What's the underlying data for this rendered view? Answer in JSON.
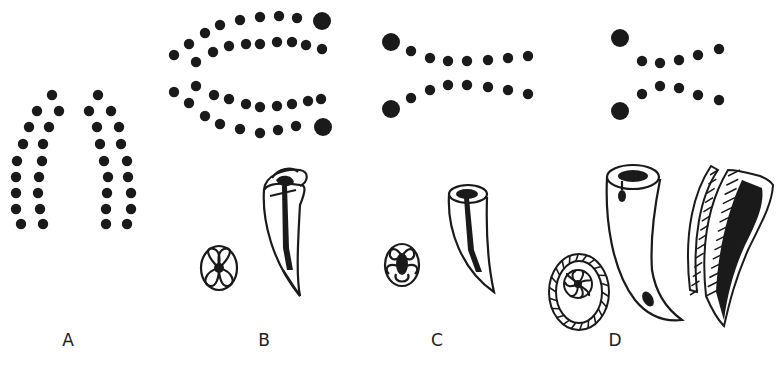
{
  "figure": {
    "panels": [
      {
        "id": "A",
        "label": "A",
        "label_x": 58
      },
      {
        "id": "B",
        "label": "B",
        "label_x": 254
      },
      {
        "id": "C",
        "label": "C",
        "label_x": 427
      },
      {
        "id": "D",
        "label": "D",
        "label_x": 605
      }
    ],
    "colors": {
      "ink": "#1a1a1a",
      "background": "#ffffff",
      "label": "#222222"
    },
    "dot_radius": 5.2,
    "big_dot_radius": 9,
    "dots": {
      "A": [
        [
          52,
          95
        ],
        [
          37,
          111
        ],
        [
          59,
          111
        ],
        [
          29,
          127
        ],
        [
          49,
          127
        ],
        [
          23,
          144
        ],
        [
          43,
          144
        ],
        [
          17,
          161
        ],
        [
          42,
          161
        ],
        [
          16,
          177
        ],
        [
          39,
          177
        ],
        [
          16,
          193
        ],
        [
          38,
          193
        ],
        [
          16,
          209
        ],
        [
          40,
          209
        ],
        [
          21,
          224
        ],
        [
          43,
          224
        ],
        [
          98,
          95
        ],
        [
          89,
          111
        ],
        [
          111,
          111
        ],
        [
          97,
          127
        ],
        [
          119,
          127
        ],
        [
          100,
          144
        ],
        [
          121,
          144
        ],
        [
          104,
          161
        ],
        [
          127,
          161
        ],
        [
          108,
          177
        ],
        [
          128,
          177
        ],
        [
          107,
          193
        ],
        [
          131,
          193
        ],
        [
          106,
          209
        ],
        [
          131,
          209
        ],
        [
          106,
          224
        ],
        [
          127,
          224
        ]
      ],
      "B": [
        [
          174,
          55
        ],
        [
          189,
          44
        ],
        [
          205,
          33
        ],
        [
          220,
          25
        ],
        [
          240,
          20
        ],
        [
          260,
          17
        ],
        [
          279,
          16
        ],
        [
          297,
          18
        ],
        [
          196,
          62
        ],
        [
          213,
          52
        ],
        [
          229,
          46
        ],
        [
          246,
          44
        ],
        [
          260,
          44
        ],
        [
          277,
          42
        ],
        [
          292,
          42
        ],
        [
          306,
          45
        ],
        [
          322,
          49
        ],
        [
          174,
          92
        ],
        [
          196,
          86
        ],
        [
          214,
          95
        ],
        [
          229,
          99
        ],
        [
          246,
          104
        ],
        [
          260,
          107
        ],
        [
          277,
          106
        ],
        [
          292,
          104
        ],
        [
          308,
          101
        ],
        [
          321,
          99
        ],
        [
          189,
          103
        ],
        [
          205,
          116
        ],
        [
          220,
          124
        ],
        [
          240,
          129
        ],
        [
          260,
          133
        ],
        [
          278,
          130
        ],
        [
          296,
          126
        ]
      ],
      "B_big": [
        [
          322,
          21
        ],
        [
          323,
          127
        ]
      ],
      "C": [
        [
          411,
          51
        ],
        [
          430,
          58
        ],
        [
          448,
          61
        ],
        [
          467,
          61
        ],
        [
          488,
          60
        ],
        [
          508,
          58
        ],
        [
          528,
          56
        ],
        [
          411,
          98
        ],
        [
          430,
          90
        ],
        [
          448,
          85
        ],
        [
          467,
          85
        ],
        [
          488,
          87
        ],
        [
          508,
          90
        ],
        [
          528,
          94
        ]
      ],
      "C_big": [
        [
          391,
          42
        ],
        [
          391,
          109
        ]
      ],
      "D": [
        [
          642,
          61
        ],
        [
          660,
          63
        ],
        [
          679,
          60
        ],
        [
          698,
          55
        ],
        [
          719,
          49
        ],
        [
          642,
          94
        ],
        [
          660,
          86
        ],
        [
          679,
          88
        ],
        [
          698,
          95
        ],
        [
          719,
          100
        ]
      ],
      "D_big": [
        [
          620,
          38
        ],
        [
          620,
          111
        ]
      ]
    }
  }
}
